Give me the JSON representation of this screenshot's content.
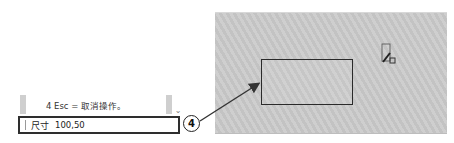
{
  "command_line": {
    "history_text": "4  Esc = 取消操作。",
    "prompt_label": "尺寸",
    "input_value": "100,50",
    "scroll_icon": "chevron-down-icon"
  },
  "callout": {
    "number": "4"
  },
  "canvas": {
    "cursor_icon": "rectangle-draw-cursor-icon",
    "shape": "rectangle"
  }
}
